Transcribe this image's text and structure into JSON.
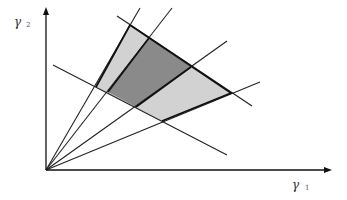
{
  "diagram": {
    "axes": {
      "x_label": "γ",
      "x_sub": "1",
      "y_label": "γ",
      "y_sub": "2",
      "origin": [
        46,
        170
      ],
      "x_end": [
        331,
        170
      ],
      "y_end": [
        46,
        8
      ]
    },
    "rays_from_origin": [
      {
        "end": [
          140,
          8
        ]
      },
      {
        "end": [
          172,
          8
        ]
      },
      {
        "end": [
          227,
          41
        ]
      },
      {
        "end": [
          260,
          82
        ]
      }
    ],
    "boundary_lines": [
      {
        "name": "upper-boundary",
        "start": [
          117,
          16
        ],
        "end": [
          252,
          106
        ]
      },
      {
        "name": "lower-boundary",
        "start": [
          53,
          65
        ],
        "end": [
          227,
          155
        ]
      }
    ],
    "regions": {
      "light_region": {
        "fill": "#d2d2d2",
        "vertices": [
          [
            130,
            25
          ],
          [
            231,
            93
          ],
          [
            162,
            121
          ],
          [
            96,
            87
          ]
        ]
      },
      "dark_region": {
        "fill": "#8a8a8a",
        "vertices": [
          [
            149,
            38
          ],
          [
            191,
            67
          ],
          [
            136,
            107
          ],
          [
            108,
            92
          ]
        ]
      }
    },
    "colors": {
      "line": "#222222",
      "axis": "#111111"
    }
  }
}
